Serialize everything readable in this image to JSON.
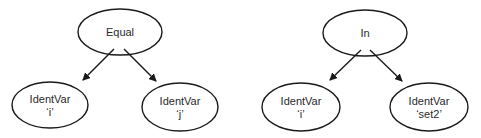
{
  "diagrams": [
    {
      "root": {
        "label": "Equal"
      },
      "children": [
        {
          "line1": "IdentVar",
          "line2": "‘i’"
        },
        {
          "line1": "IdentVar",
          "line2": "‘j’"
        }
      ]
    },
    {
      "root": {
        "label": "In"
      },
      "children": [
        {
          "line1": "IdentVar",
          "line2": "‘i’"
        },
        {
          "line1": "IdentVar",
          "line2": "‘set2’"
        }
      ]
    }
  ],
  "colors": {
    "stroke": "#1a1a1a",
    "background": "#ffffff"
  }
}
